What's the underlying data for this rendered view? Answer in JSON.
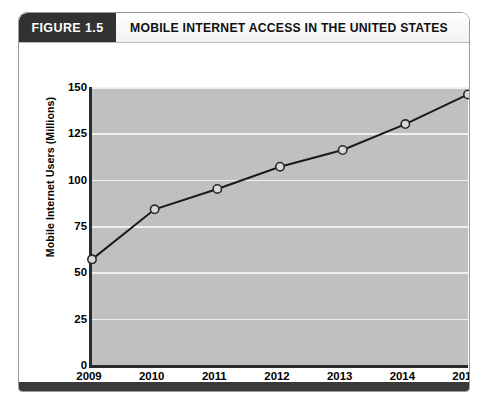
{
  "figure": {
    "number_label": "FIGURE 1.5",
    "title": "MOBILE INTERNET ACCESS IN THE UNITED STATES"
  },
  "colors": {
    "header_block": "#323232",
    "plot_background": "#c0c0c0",
    "gridline": "#efefef",
    "line": "#1a1a1a",
    "marker_fill": "#d8d8d8",
    "marker_stroke": "#2b2b2b",
    "axis": "#2b2b2b",
    "footer_bar": "#3a3a3a"
  },
  "chart_data": {
    "type": "line",
    "title": "MOBILE INTERNET ACCESS IN THE UNITED STATES",
    "xlabel": "Year",
    "ylabel": "Mobile Internet Users (Millions)",
    "categories": [
      "2009",
      "2010",
      "2011",
      "2012",
      "2013",
      "2014",
      "2015"
    ],
    "x": [
      2009,
      2010,
      2011,
      2012,
      2013,
      2014,
      2015
    ],
    "values": [
      57,
      84,
      95,
      107,
      116,
      130,
      146
    ],
    "yticks": [
      0,
      25,
      50,
      75,
      100,
      125,
      150
    ],
    "ylim": [
      0,
      150
    ],
    "xlim": [
      2009,
      2015
    ],
    "grid": true,
    "legend": null,
    "markers": "open-circle"
  }
}
